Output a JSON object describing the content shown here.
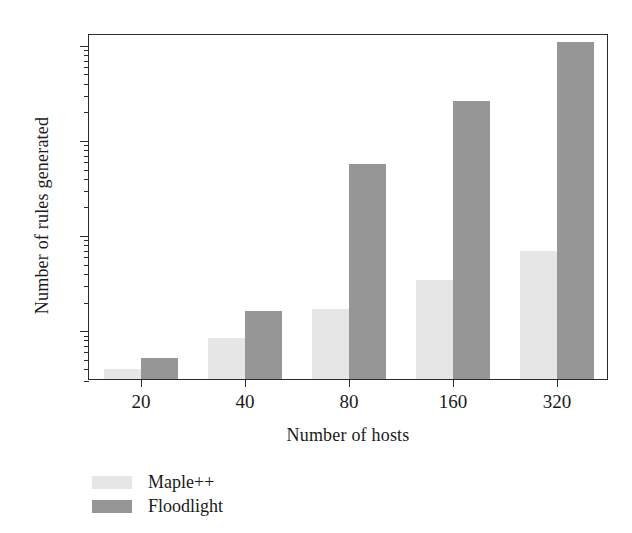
{
  "chart_data": {
    "type": "bar",
    "title": "",
    "xlabel": "Number of hosts",
    "ylabel": "Number of rules generated",
    "categories": [
      "20",
      "40",
      "80",
      "160",
      "320"
    ],
    "yscale": "log",
    "ylim": [
      30,
      130000
    ],
    "yticks": [
      100,
      1000,
      10000,
      100000
    ],
    "ytick_labels": [
      "10²",
      "10³",
      "10⁴",
      "10⁵"
    ],
    "grid": false,
    "legend_position": "below-left",
    "series": [
      {
        "name": "Maple++",
        "color": "#e6e6e6",
        "values": [
          38,
          80,
          165,
          330,
          660
        ]
      },
      {
        "name": "Floodlight",
        "color": "#969696",
        "values": [
          50,
          155,
          5500,
          25000,
          105000
        ]
      }
    ]
  },
  "axes": {
    "y_title": "Number of rules generated",
    "x_title": "Number of hosts",
    "y_tick_bases": [
      "10",
      "10",
      "10",
      "10"
    ],
    "y_tick_exponents": [
      "2",
      "3",
      "4",
      "5"
    ],
    "x_tick_labels": [
      "20",
      "40",
      "80",
      "160",
      "320"
    ]
  },
  "legend": {
    "entries": [
      {
        "label": "Maple++",
        "color": "#e6e6e6"
      },
      {
        "label": "Floodlight",
        "color": "#969696"
      }
    ]
  },
  "colors": {
    "maple": "#e6e6e6",
    "floodlight": "#969696",
    "axis": "#2b2b2b",
    "background": "#ffffff"
  }
}
